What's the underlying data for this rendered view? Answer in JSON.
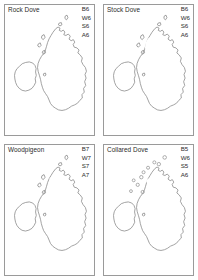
{
  "figure": {
    "layout": "2x2-grid",
    "region": "British Isles",
    "style": "grayscale distribution maps with stippled fill"
  },
  "panels": [
    {
      "id": "rock-dove",
      "title": "Rock Dove",
      "position": "top-left",
      "codes": [
        "B6",
        "W6",
        "S6",
        "A6"
      ],
      "code_labels": {
        "B": "B6",
        "W": "W6",
        "S": "S6",
        "A": "A6"
      },
      "distribution": {
        "ireland": "coastal-rim-only",
        "scotland": "widespread-coastal",
        "england": "dense-inland",
        "wales": "partial"
      }
    },
    {
      "id": "stock-dove",
      "title": "Stock Dove",
      "position": "top-right",
      "codes": [
        "B6",
        "W6",
        "S6",
        "A6"
      ],
      "code_labels": {
        "B": "B6",
        "W": "W6",
        "S": "S6",
        "A": "A6"
      },
      "distribution": {
        "ireland": "moderate-light",
        "scotland": "southern-and-east",
        "england": "dense",
        "wales": "dense"
      }
    },
    {
      "id": "woodpigeon",
      "title": "Woodpigeon",
      "position": "bottom-left",
      "codes": [
        "B7",
        "W7",
        "S7",
        "A7"
      ],
      "code_labels": {
        "B": "B7",
        "W": "W7",
        "S": "S7",
        "A": "A7"
      },
      "distribution": {
        "ireland": "complete",
        "scotland": "near-complete",
        "england": "complete",
        "wales": "complete"
      }
    },
    {
      "id": "collared-dove",
      "title": "Collared Dove",
      "position": "bottom-right",
      "codes": [
        "B5",
        "W6",
        "S5",
        "A6"
      ],
      "code_labels": {
        "B": "B5",
        "W": "W6",
        "S": "S5",
        "A": "A6"
      },
      "distribution": {
        "ireland": "widespread",
        "scotland": "widespread-with-island-dots",
        "england": "complete",
        "wales": "complete"
      }
    }
  ],
  "colors": {
    "page_background": "#ffffff",
    "panel_border": "#9a9a9a",
    "coastline": "#8d8d8d",
    "fill_dense": "#9b9b9b",
    "fill_mid": "#b4b4b4",
    "fill_light": "#cfcfcf",
    "text": "#2b2b2b"
  }
}
